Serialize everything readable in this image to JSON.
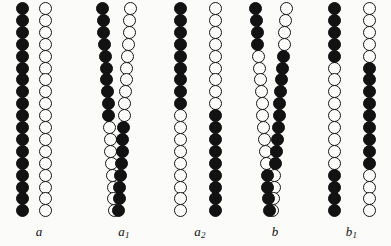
{
  "figure": {
    "background_color": "#fbfbfa",
    "filled_color": "#121212",
    "open_color": "#fdfdfc",
    "outline_color": "#161616",
    "bead_diameter": 13,
    "bead_pitch": 11.9,
    "bead_count": 18,
    "chain_top": 2
  },
  "legend": {
    "filled_meaning": "filled-bead",
    "open_meaning": "open-bead"
  },
  "groups": [
    {
      "id": "a",
      "label": "a",
      "subscript": "",
      "left": 0,
      "width": 78,
      "label_center": 40,
      "description": "Paired homologues before crossing over: one entirely filled chain and one entirely open chain, no exchange.",
      "crossovers": 0,
      "chains": [
        {
          "name": "chain-left",
          "x": 16,
          "tilt": 0,
          "segments": [
            {
              "type": "filled",
              "from": 0,
              "to": 18
            }
          ]
        },
        {
          "name": "chain-right",
          "x": 39,
          "tilt": 0,
          "segments": [
            {
              "type": "open",
              "from": 0,
              "to": 18
            }
          ]
        }
      ]
    },
    {
      "id": "a1",
      "label": "a",
      "subscript": "1",
      "left": 88,
      "width": 72,
      "label_center": 34,
      "description": "Single chiasma: the two chromatids cross once near the middle, the strands visually swapping sides.",
      "crossovers": 1,
      "chains": [
        {
          "name": "chain-left",
          "x": 14,
          "tilt": 6,
          "segments": [
            {
              "type": "filled",
              "from": 0,
              "to": 10
            },
            {
              "type": "open",
              "from": 10,
              "to": 18
            }
          ]
        },
        {
          "name": "chain-right",
          "x": 30,
          "tilt": -6,
          "segments": [
            {
              "type": "open",
              "from": 0,
              "to": 10
            },
            {
              "type": "filled",
              "from": 10,
              "to": 18
            }
          ]
        }
      ]
    },
    {
      "id": "a2",
      "label": "a",
      "subscript": "2",
      "left": 160,
      "width": 80,
      "label_center": 40,
      "description": "Result of the single exchange drawn apart: each chromatid is filled above the break point and open below, or the reverse.",
      "crossovers": 1,
      "chains": [
        {
          "name": "chain-left",
          "x": 14,
          "tilt": 0,
          "segments": [
            {
              "type": "filled",
              "from": 0,
              "to": 9
            },
            {
              "type": "open",
              "from": 9,
              "to": 18
            }
          ]
        },
        {
          "name": "chain-right",
          "x": 49,
          "tilt": 0,
          "segments": [
            {
              "type": "open",
              "from": 0,
              "to": 9
            },
            {
              "type": "filled",
              "from": 9,
              "to": 18
            }
          ]
        }
      ]
    },
    {
      "id": "b",
      "label": "b",
      "subscript": "",
      "left": 240,
      "width": 70,
      "label_center": 33,
      "description": "Double chiasma: the paired chromatids cross twice, once in the upper third and once in the lower third.",
      "crossovers": 2,
      "chains": [
        {
          "name": "chain-left",
          "x": 16,
          "tilt": 7,
          "segments": [
            {
              "type": "filled",
              "from": 0,
              "to": 4
            },
            {
              "type": "open",
              "from": 4,
              "to": 14
            },
            {
              "type": "filled",
              "from": 14,
              "to": 18
            }
          ]
        },
        {
          "name": "chain-right",
          "x": 33,
          "tilt": -7,
          "segments": [
            {
              "type": "open",
              "from": 0,
              "to": 4
            },
            {
              "type": "filled",
              "from": 4,
              "to": 14
            },
            {
              "type": "open",
              "from": 14,
              "to": 18
            }
          ]
        }
      ]
    },
    {
      "id": "b1",
      "label": "b",
      "subscript": "1",
      "left": 312,
      "width": 79,
      "label_center": 40,
      "description": "Result of the double exchange drawn apart: each chromatid carries an interstitial segment of the opposite colour.",
      "crossovers": 2,
      "chains": [
        {
          "name": "chain-left",
          "x": 16,
          "tilt": 0,
          "segments": [
            {
              "type": "filled",
              "from": 0,
              "to": 5
            },
            {
              "type": "open",
              "from": 5,
              "to": 14
            },
            {
              "type": "filled",
              "from": 14,
              "to": 18
            }
          ]
        },
        {
          "name": "chain-right",
          "x": 51,
          "tilt": 0,
          "segments": [
            {
              "type": "open",
              "from": 0,
              "to": 5
            },
            {
              "type": "filled",
              "from": 5,
              "to": 14
            },
            {
              "type": "open",
              "from": 14,
              "to": 18
            }
          ]
        }
      ]
    }
  ]
}
